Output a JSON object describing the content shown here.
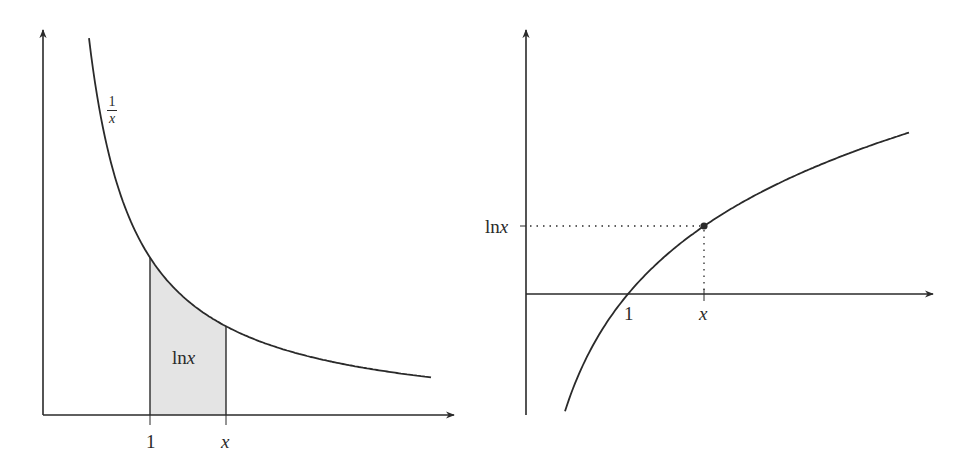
{
  "chart_data": [
    {
      "type": "line",
      "title": "",
      "description": "Graph of 1/x with shaded area from 1 to x equal to ln x",
      "curve_label": {
        "numerator": "1",
        "denominator": "x"
      },
      "area_label": {
        "prefix": "ln",
        "var": "x"
      },
      "x_ticks": [
        {
          "label": "1",
          "value": 1
        },
        {
          "label": "x",
          "value": 1.71
        }
      ],
      "xlabel": "",
      "ylabel": "",
      "grid": false,
      "series": [
        {
          "name": "1/x",
          "function": "1/x",
          "domain": [
            0.43,
            3.63
          ]
        }
      ],
      "shaded_region": {
        "from": 1,
        "to": 1.71,
        "fill": "#e4e4e4"
      }
    },
    {
      "type": "line",
      "title": "",
      "description": "Graph of ln x with marked point (x, ln x)",
      "y_ticks": [
        {
          "prefix": "ln",
          "var": "x"
        }
      ],
      "x_ticks": [
        {
          "label": "1",
          "value": 1
        },
        {
          "label": "x",
          "value": 1.75
        }
      ],
      "xlabel": "",
      "ylabel": "",
      "grid": false,
      "series": [
        {
          "name": "ln x",
          "function": "ln(x)",
          "domain": [
            0.38,
            3.76
          ]
        }
      ],
      "marked_point": {
        "x": 1.75,
        "y": 0.56
      }
    }
  ],
  "colors": {
    "stroke": "#2a2a2a",
    "shade": "#e4e4e4",
    "background": "#ffffff"
  }
}
